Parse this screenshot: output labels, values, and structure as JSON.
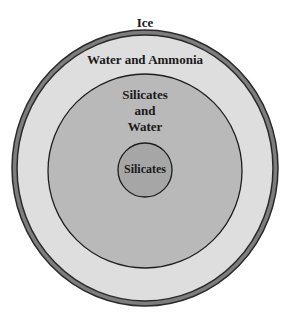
{
  "diagram": {
    "layers": [
      {
        "name": "Ice",
        "fill": "#7a7a7a"
      },
      {
        "name": "Water and Ammonia",
        "fill": "#dedede"
      },
      {
        "name": "Silicates and Water",
        "fill": "#b9b9b9"
      },
      {
        "name": "Silicates",
        "fill": "#a6a6a6"
      }
    ],
    "labels": {
      "ice": "Ice",
      "water_ammonia": "Water and Ammonia",
      "silicates_water_line1": "Silicates",
      "silicates_water_line2": "and",
      "silicates_water_line3": "Water",
      "silicates_core": "Silicates"
    }
  }
}
